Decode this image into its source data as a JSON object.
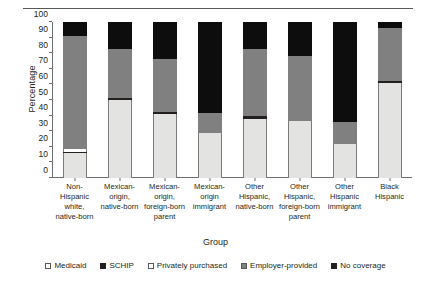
{
  "chart_data": {
    "type": "bar",
    "subtype": "stacked-bar-100",
    "title": "",
    "xlabel": "Group",
    "ylabel": "Percentage",
    "ylim": [
      0,
      100
    ],
    "yticks": [
      0,
      10,
      20,
      30,
      40,
      50,
      60,
      70,
      80,
      90,
      100
    ],
    "grid": false,
    "legend_position": "bottom",
    "categories": [
      "Non-Hispanic white, native-born",
      "Mexican-origin, native-born",
      "Mexican-origin, foreign-born parent",
      "Mexican-origin immigrant",
      "Other Hispanic, native-born",
      "Other Hispanic, foreign-born parent",
      "Other Hispanic immigrant",
      "Black Hispanic"
    ],
    "category_lines": [
      [
        "Non-Hispanic",
        "white,",
        "native-born"
      ],
      [
        "Mexican-",
        "origin,",
        "native-born"
      ],
      [
        "Mexican-",
        "origin,",
        "foreign-born",
        "parent"
      ],
      [
        "Mexican-",
        "origin",
        "immigrant"
      ],
      [
        "Other",
        "Hispanic,",
        "native-born"
      ],
      [
        "Other",
        "Hispanic,",
        "foreign-born",
        "parent"
      ],
      [
        "Other",
        "Hispanic",
        "immigrant"
      ],
      [
        "Black",
        "Hispanic"
      ]
    ],
    "series": [
      {
        "name": "Medicaid",
        "color": "#e3e3e1",
        "values": [
          16,
          50,
          41,
          29,
          38,
          36.5,
          22,
          61
        ]
      },
      {
        "name": "SCHIP",
        "color": "#231f20",
        "values": [
          1,
          1.5,
          1.5,
          0,
          1.5,
          0,
          0,
          1.5
        ]
      },
      {
        "name": "Privately purchased",
        "color": "#ffffff",
        "values": [
          1.5,
          0,
          0,
          0,
          0,
          0,
          0,
          0
        ]
      },
      {
        "name": "Employer-provided",
        "color": "#808080",
        "values": [
          72.5,
          31,
          33.5,
          13,
          43.5,
          42,
          14,
          33.5
        ]
      },
      {
        "name": "No coverage",
        "color": "#0d0d0d",
        "values": [
          9,
          17.5,
          24,
          58,
          17,
          21.5,
          64,
          4
        ]
      }
    ],
    "legend": [
      {
        "label": "Medicaid",
        "swatch": "open"
      },
      {
        "label": "SCHIP",
        "swatch": "black"
      },
      {
        "label": "Privately purchased",
        "swatch": "open"
      },
      {
        "label": "Employer-provided",
        "swatch": "gray"
      },
      {
        "label": "No coverage",
        "swatch": "black"
      }
    ]
  }
}
